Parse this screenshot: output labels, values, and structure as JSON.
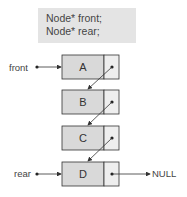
{
  "code": {
    "lines": [
      "Node* front;",
      "Node* rear;"
    ]
  },
  "pointers": {
    "front_label": "front",
    "rear_label": "rear",
    "null_label": "NULL"
  },
  "nodes": [
    {
      "value": "A"
    },
    {
      "value": "B"
    },
    {
      "value": "C"
    },
    {
      "value": "D"
    }
  ],
  "colors": {
    "data_cell": "#d9d9d9",
    "pointer_cell": "#eeeeee",
    "code_bg": "#e4e4e4",
    "stroke": "#333333"
  }
}
